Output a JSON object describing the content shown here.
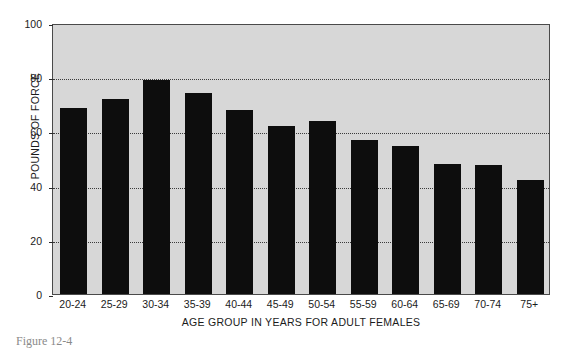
{
  "chart_data": {
    "type": "bar",
    "title": "",
    "xlabel": "AGE GROUP IN YEARS FOR ADULT FEMALES",
    "ylabel": "POUNDS OF FORCE",
    "categories": [
      "20-24",
      "25-29",
      "30-34",
      "35-39",
      "40-44",
      "45-49",
      "50-54",
      "55-59",
      "60-64",
      "65-69",
      "70-74",
      "75+"
    ],
    "values": [
      68.5,
      72,
      79,
      74,
      68,
      62,
      64,
      57,
      54.5,
      48,
      47.5,
      42
    ],
    "ylim": [
      0,
      100
    ],
    "yticks": [
      0,
      20,
      40,
      60,
      80,
      100
    ],
    "ytick_labels": [
      "0",
      "20",
      "40",
      "60",
      "80",
      "100"
    ],
    "grid": "horizontal-dotted",
    "legend": "none",
    "bar_color": "#0d0d0d",
    "plot_background": "#d7d7d7"
  },
  "caption": {
    "text": "Figure 12-4"
  }
}
